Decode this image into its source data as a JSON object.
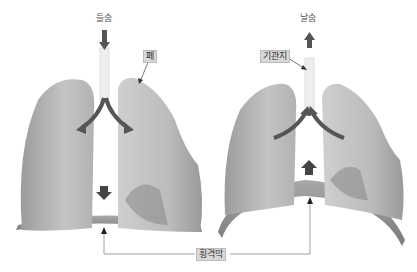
{
  "figure": {
    "panels": [
      {
        "id": "inhale",
        "label": "들숨",
        "airflow": "in",
        "diaphragm_motion": "down"
      },
      {
        "id": "exhale",
        "label": "날숨",
        "airflow": "out",
        "diaphragm_motion": "up"
      }
    ],
    "callouts": {
      "lung": "폐",
      "bronchus": "기관지",
      "diaphragm": "횡격막"
    },
    "colors": {
      "lung_fill": "#bdbdbd",
      "lung_shadow": "#8f8f8f",
      "diaphragm": "#9a9a9a",
      "arrow": "#555555",
      "label_box": "#d8d8d8"
    }
  }
}
